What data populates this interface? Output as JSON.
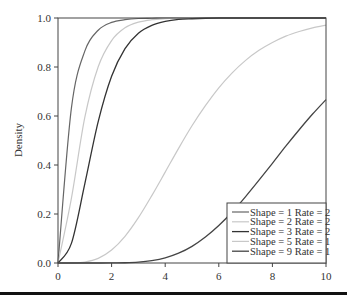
{
  "chart_data": {
    "type": "line",
    "title": "",
    "xlabel": "",
    "ylabel": "Density",
    "xlim": [
      0,
      10
    ],
    "ylim": [
      0,
      1
    ],
    "grid": false,
    "legend_position": "lower right",
    "x_ticks": [
      "0",
      "2",
      "4",
      "6",
      "8",
      "10"
    ],
    "y_ticks": [
      "0.0",
      "0.2",
      "0.4",
      "0.6",
      "0.8",
      "1.0"
    ],
    "x": [
      0,
      0.5,
      1,
      1.5,
      2,
      2.5,
      3,
      3.5,
      4,
      4.5,
      5,
      5.5,
      6,
      6.5,
      7,
      7.5,
      8,
      8.5,
      9,
      9.5,
      10
    ],
    "series": [
      {
        "name": "Shape = 1 Rate = 2",
        "color": "#666666",
        "width": 1.2,
        "values": [
          0,
          0.632,
          0.865,
          0.95,
          0.982,
          0.993,
          0.998,
          0.999,
          1,
          1,
          1,
          1,
          1,
          1,
          1,
          1,
          1,
          1,
          1,
          1,
          1
        ]
      },
      {
        "name": "Shape = 2 Rate = 2",
        "color": "#c8c8c8",
        "width": 1.2,
        "values": [
          0,
          0.264,
          0.594,
          0.801,
          0.908,
          0.96,
          0.983,
          0.993,
          0.997,
          0.999,
          1,
          1,
          1,
          1,
          1,
          1,
          1,
          1,
          1,
          1,
          1
        ]
      },
      {
        "name": "Shape = 3 Rate = 2",
        "color": "#333333",
        "width": 1.3,
        "values": [
          0,
          0.08,
          0.323,
          0.577,
          0.762,
          0.875,
          0.938,
          0.97,
          0.986,
          0.994,
          0.997,
          0.999,
          1,
          1,
          1,
          1,
          1,
          1,
          1,
          1,
          1
        ]
      },
      {
        "name": "Shape = 5 Rate = 1",
        "color": "#c8c8c8",
        "width": 1.2,
        "values": [
          0,
          0.0002,
          0.004,
          0.019,
          0.053,
          0.109,
          0.185,
          0.275,
          0.371,
          0.468,
          0.56,
          0.642,
          0.715,
          0.776,
          0.827,
          0.868,
          0.9,
          0.926,
          0.945,
          0.96,
          0.971
        ]
      },
      {
        "name": "Shape = 9 Rate = 1",
        "color": "#444444",
        "width": 1.3,
        "values": [
          0,
          0,
          0,
          0,
          0.0002,
          0.0011,
          0.0038,
          0.0099,
          0.021,
          0.04,
          0.068,
          0.106,
          0.153,
          0.208,
          0.271,
          0.338,
          0.407,
          0.477,
          0.544,
          0.608,
          0.667
        ]
      }
    ]
  }
}
